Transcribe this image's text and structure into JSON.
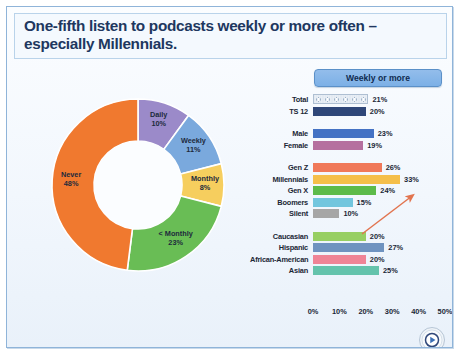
{
  "slide": {
    "title": "One-fifth listen to podcasts weekly or more often – especially Millennials.",
    "accent_blue": "#20375f",
    "panel_border": "#8fb4d9"
  },
  "legend": {
    "button_label": "Weekly or more"
  },
  "logo": {
    "name": "play-button-seal-logo"
  },
  "chart_data": [
    {
      "type": "pie",
      "variant": "donut",
      "title": "Podcast listening frequency",
      "categories": [
        "Daily",
        "Weekly",
        "Monthly",
        "< Monthly",
        "Never"
      ],
      "values": [
        10,
        11,
        8,
        23,
        48
      ],
      "value_labels": [
        "10%",
        "11%",
        "8%",
        "23%",
        "48%"
      ],
      "colors": [
        "#9b8ac9",
        "#7aa9dd",
        "#f6ce5e",
        "#69bd55",
        "#f0792f"
      ],
      "legend": "inside-slices",
      "grid": false
    },
    {
      "type": "bar",
      "orientation": "horizontal",
      "title": "Weekly or more",
      "xlabel": "",
      "ylabel": "",
      "xlim": [
        0,
        50
      ],
      "xticks": [
        0,
        10,
        20,
        30,
        40,
        50
      ],
      "xtick_labels": [
        "0%",
        "10%",
        "20%",
        "30%",
        "40%",
        "50%"
      ],
      "grid": false,
      "groups": [
        {
          "name": "overall",
          "categories": [
            "Total",
            "TS 12"
          ],
          "values": [
            21,
            20
          ],
          "value_labels": [
            "21%",
            "20%"
          ],
          "colors": [
            "#dfe7f0",
            "#2f4779"
          ],
          "patterns": [
            "circles",
            "solid"
          ]
        },
        {
          "name": "gender",
          "categories": [
            "Male",
            "Female"
          ],
          "values": [
            23,
            19
          ],
          "value_labels": [
            "23%",
            "19%"
          ],
          "colors": [
            "#4472c4",
            "#b5709f"
          ],
          "patterns": [
            "solid",
            "solid"
          ]
        },
        {
          "name": "generation",
          "categories": [
            "Gen Z",
            "Millennials",
            "Gen X",
            "Boomers",
            "Silent"
          ],
          "values": [
            26,
            33,
            24,
            15,
            10
          ],
          "value_labels": [
            "26%",
            "33%",
            "24%",
            "15%",
            "10%"
          ],
          "colors": [
            "#f0795a",
            "#f5bf4a",
            "#5dbb4a",
            "#72c6de",
            "#a6a6a6"
          ],
          "patterns": [
            "solid",
            "solid",
            "solid",
            "solid",
            "solid"
          ]
        },
        {
          "name": "ethnicity",
          "categories": [
            "Caucasian",
            "Hispanic",
            "African-American",
            "Asian"
          ],
          "values": [
            20,
            27,
            20,
            25
          ],
          "value_labels": [
            "20%",
            "27%",
            "20%",
            "25%"
          ],
          "colors": [
            "#97cf63",
            "#6f93c0",
            "#ef8496",
            "#64c3ac"
          ],
          "patterns": [
            "solid",
            "solid",
            "solid",
            "solid"
          ]
        }
      ],
      "annotations": [
        {
          "type": "arrow",
          "points_to": "Millennials",
          "points_to_value": "33%",
          "color": "#e2744f"
        }
      ]
    }
  ]
}
